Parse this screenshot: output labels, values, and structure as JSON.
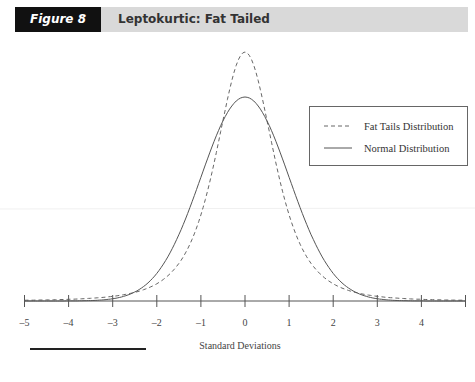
{
  "header": {
    "figure_label": "Figure 8",
    "title": "Leptokurtic: Fat Tailed",
    "label_bg": "#111111",
    "bar_bg": "#d9d9d9"
  },
  "chart_data": {
    "type": "line",
    "title": "Leptokurtic: Fat Tailed",
    "xlabel": "Standard Deviations",
    "ylabel": "",
    "xlim": [
      -5,
      5
    ],
    "x_ticks": [
      -5,
      -4,
      -3,
      -2,
      -1,
      0,
      1,
      2,
      3,
      4,
      5
    ],
    "x_tick_labels": [
      "–5",
      "–4",
      "–3",
      "–2",
      "–1",
      "0",
      "1",
      "2",
      "3",
      "4",
      ""
    ],
    "grid": false,
    "y_axis_visible": false,
    "legend_position": "upper right",
    "series": [
      {
        "name": "Fat Tails Distribution",
        "style": "dashed",
        "model": "scaled Student-t, df=3, scale=0.69",
        "relative_peak": 1.22,
        "x": [
          -5,
          -4,
          -3,
          -2,
          -1.5,
          -1,
          -0.5,
          0,
          0.5,
          1,
          1.5,
          2,
          3,
          4,
          5
        ],
        "relative_height": [
          0.004,
          0.008,
          0.019,
          0.062,
          0.152,
          0.35,
          0.745,
          1.0,
          0.745,
          0.35,
          0.152,
          0.062,
          0.019,
          0.008,
          0.004
        ]
      },
      {
        "name": "Normal Distribution",
        "style": "solid",
        "model": "standard normal, sigma=1",
        "relative_peak": 1.0,
        "x": [
          -5,
          -4,
          -3,
          -2,
          -1.5,
          -1,
          -0.5,
          0,
          0.5,
          1,
          1.5,
          2,
          3,
          4,
          5
        ],
        "relative_height": [
          0.0,
          0.0003,
          0.011,
          0.135,
          0.325,
          0.607,
          0.882,
          1.0,
          0.882,
          0.607,
          0.325,
          0.135,
          0.011,
          0.0003,
          0.0
        ]
      }
    ]
  },
  "plot": {
    "x0_px": 245,
    "px_per_unit": 44.1,
    "axis_y_px": 301,
    "normal_peak_px": 204,
    "fat_peak_px": 249,
    "t_df": 3,
    "t_scale": 0.69,
    "line_color": "#555555"
  },
  "legend": {
    "items": [
      {
        "label": "Fat Tails Distribution",
        "style": "dashed"
      },
      {
        "label": "Normal Distribution",
        "style": "solid"
      }
    ]
  },
  "axis": {
    "title": "Standard Deviations"
  }
}
